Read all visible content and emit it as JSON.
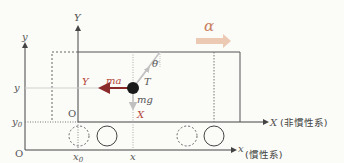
{
  "diagram": {
    "title": "",
    "labels": {
      "alpha": "α",
      "Y_axis": "Y",
      "y_axis": "y",
      "y_left": "y",
      "y0": "y",
      "y0_sub": "0",
      "origin_inertial": "O",
      "origin_noninertial": "O",
      "x0": "x",
      "x0_sub": "0",
      "x_pos": "x",
      "X_axis": "X",
      "X_axis_note": "(非慣性系)",
      "x_axis": "x",
      "x_axis_note": "(慣性系)",
      "Y_red": "Y",
      "X_red": "X",
      "ma": "ma",
      "T": "T",
      "theta": "θ",
      "mg": "mg"
    },
    "colors": {
      "axis": "#444444",
      "red_force": "#8b2a2a",
      "red_label": "#b5473a",
      "alpha_arrow": "#e8c6b0",
      "bob": "#1a1a1a",
      "string": "#bdbdbd",
      "gravity_arrow": "#c8c8c8"
    }
  }
}
